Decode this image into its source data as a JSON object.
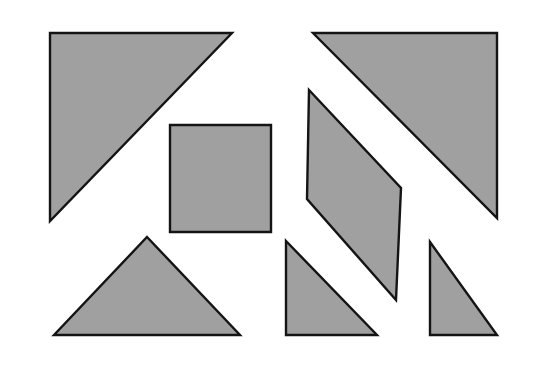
{
  "canvas": {
    "width": 546,
    "height": 371,
    "background_color": "#ffffff",
    "title": "Tangram Pieces Layout"
  },
  "style": {
    "fill_color": "#a0a0a0",
    "stroke_color": "#141414",
    "stroke_width": 2.4
  },
  "shapes": [
    {
      "id": "large-triangle-left",
      "name": "large-right-triangle-upper-left",
      "type": "triangle",
      "points": "50,33 232,33 50,221",
      "vertices": [
        [
          50,
          33
        ],
        [
          232,
          33
        ],
        [
          50,
          221
        ]
      ],
      "fill": "#a0a0a0",
      "stroke": "#141414"
    },
    {
      "id": "square-center",
      "name": "square",
      "type": "square",
      "points": "170,125 271,125 271,232 170,232",
      "vertices": [
        [
          170,
          125
        ],
        [
          271,
          125
        ],
        [
          271,
          232
        ],
        [
          170,
          232
        ]
      ],
      "fill": "#a0a0a0",
      "stroke": "#141414"
    },
    {
      "id": "large-triangle-right",
      "name": "large-right-triangle-upper-right",
      "type": "triangle",
      "points": "313,33 497,33 497,218",
      "vertices": [
        [
          313,
          33
        ],
        [
          497,
          33
        ],
        [
          497,
          218
        ]
      ],
      "fill": "#a0a0a0",
      "stroke": "#141414"
    },
    {
      "id": "parallelogram-center",
      "name": "parallelogram",
      "type": "parallelogram",
      "points": "309,90 401,188 396,300 307,199",
      "vertices": [
        [
          309,
          90
        ],
        [
          401,
          188
        ],
        [
          396,
          300
        ],
        [
          307,
          199
        ]
      ],
      "fill": "#a0a0a0",
      "stroke": "#141414"
    },
    {
      "id": "medium-triangle-bottom-left",
      "name": "medium-isoceles-triangle-bottom-left",
      "type": "triangle",
      "points": "147,237 240,335 54,335",
      "vertices": [
        [
          147,
          237
        ],
        [
          240,
          335
        ],
        [
          54,
          335
        ]
      ],
      "fill": "#a0a0a0",
      "stroke": "#141414"
    },
    {
      "id": "small-triangle-bottom-center",
      "name": "small-right-triangle-bottom-center",
      "type": "triangle",
      "points": "286,241 377,335 286,335",
      "vertices": [
        [
          286,
          241
        ],
        [
          377,
          335
        ],
        [
          286,
          335
        ]
      ],
      "fill": "#a0a0a0",
      "stroke": "#141414"
    },
    {
      "id": "small-triangle-bottom-right",
      "name": "small-right-triangle-bottom-right",
      "type": "triangle",
      "points": "430,242 497,335 430,335",
      "vertices": [
        [
          430,
          242
        ],
        [
          497,
          335
        ],
        [
          430,
          335
        ]
      ],
      "fill": "#a0a0a0",
      "stroke": "#141414"
    }
  ]
}
